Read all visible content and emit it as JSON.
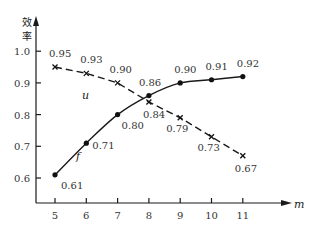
{
  "chart_data": {
    "type": "line",
    "title": "",
    "xlabel": "m",
    "ylabel": "效率",
    "x": [
      5,
      6,
      7,
      8,
      9,
      10,
      11
    ],
    "xlim": [
      4.4,
      12.3
    ],
    "ylim": [
      0.53,
      1.1
    ],
    "y_ticks": [
      "0.6",
      "0.7",
      "0.8",
      "0.9",
      "1.0"
    ],
    "x_ticks": [
      "5",
      "6",
      "7",
      "8",
      "9",
      "10",
      "11"
    ],
    "grid": false,
    "legend": "none (series labeled inline)",
    "series": [
      {
        "name": "u",
        "style": "dashed",
        "marker": "x",
        "values": [
          0.95,
          0.93,
          0.9,
          0.84,
          0.79,
          0.73,
          0.67
        ],
        "labels": [
          "0.95",
          "0.93",
          "0.90",
          "0.84",
          "0.79",
          "0.73",
          "0.67"
        ]
      },
      {
        "name": "f",
        "style": "solid",
        "marker": "dot",
        "values": [
          0.61,
          0.71,
          0.8,
          0.86,
          0.9,
          0.91,
          0.92
        ],
        "labels": [
          "0.61",
          "0.71",
          "0.80",
          "0.86",
          "0.90",
          "0.91",
          "0.92"
        ]
      }
    ]
  },
  "axis": {
    "y_title_line1": "效",
    "y_title_line2": "率",
    "x_title": "m"
  },
  "colors": {
    "line": "#1a1a1a",
    "text": "#333333",
    "background": "#ffffff"
  }
}
